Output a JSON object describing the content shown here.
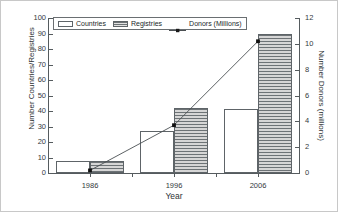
{
  "chart_data": {
    "type": "bar",
    "title": "",
    "xlabel": "Year",
    "ylabel": "Number Countries/Registries",
    "y2label": "Number Donors (millions)",
    "categories": [
      "1986",
      "1996",
      "2006"
    ],
    "ylim": [
      0,
      100
    ],
    "y2lim": [
      0,
      12
    ],
    "yticks": [
      0,
      10,
      20,
      30,
      40,
      50,
      60,
      70,
      80,
      90,
      100
    ],
    "y2ticks": [
      0,
      2,
      4,
      6,
      8,
      10,
      12
    ],
    "grid": false,
    "legend_position": "top-left",
    "series": [
      {
        "name": "Countries",
        "type": "bar",
        "axis": "left",
        "values": [
          8,
          27,
          41
        ]
      },
      {
        "name": "Registries",
        "type": "bar",
        "axis": "left",
        "values": [
          8,
          42,
          90
        ]
      },
      {
        "name": "Donors (Millions)",
        "type": "line",
        "axis": "right",
        "values": [
          0.2,
          3.7,
          10.2
        ]
      }
    ]
  },
  "legend": {
    "items": [
      {
        "label": "Countries",
        "swatch": "hollow-rect-icon"
      },
      {
        "label": "Registries",
        "swatch": "hatched-rect-icon"
      },
      {
        "label": "Donors (Millions)",
        "swatch": "line-marker-icon"
      }
    ]
  },
  "axes": {
    "left_title": "Number Countries/Registries",
    "right_title": "Number Donors (millions)",
    "bottom_title": "Year",
    "left_ticks": [
      "0",
      "10",
      "20",
      "30",
      "40",
      "50",
      "60",
      "70",
      "80",
      "90",
      "100"
    ],
    "right_ticks": [
      "0",
      "2",
      "4",
      "6",
      "8",
      "10",
      "12"
    ],
    "bottom_ticks": [
      "1986",
      "1996",
      "2006"
    ]
  },
  "colors": {
    "axis": "#555b5e",
    "bar_outline": "#5e6468",
    "hatch": "#6d7376",
    "line": "#4a4f52",
    "text": "#2e3335"
  }
}
